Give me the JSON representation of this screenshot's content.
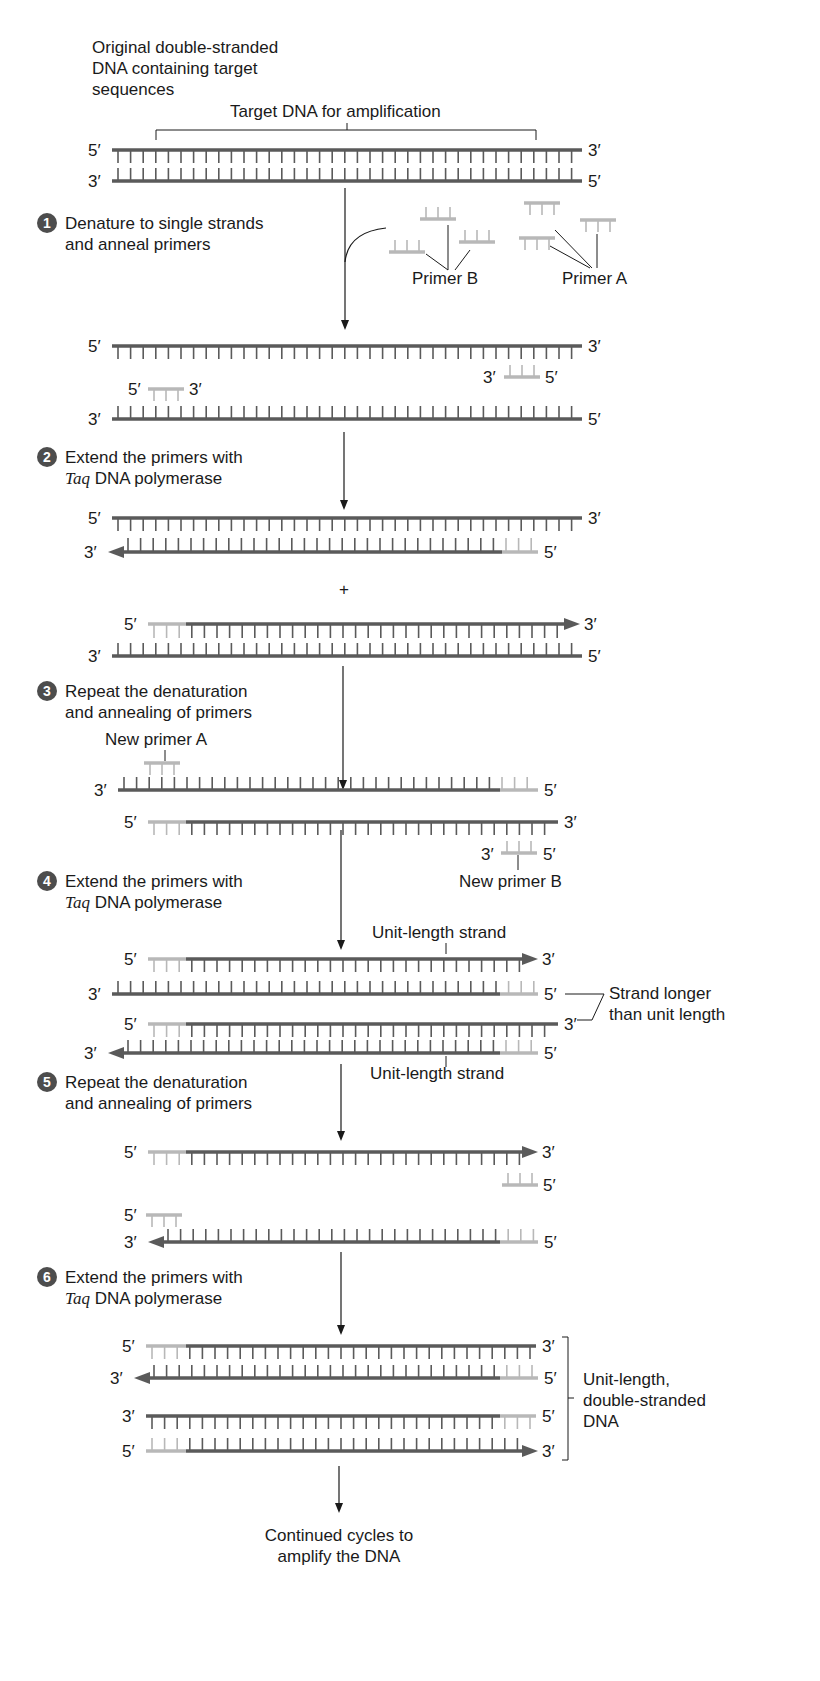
{
  "colors": {
    "strand": "#5a5a5a",
    "primer": "#b8b8b8",
    "text": "#1a1a1a",
    "step_badge": "#4d4d4d",
    "background": "#ffffff"
  },
  "header": {
    "title_lines": [
      "Original double-stranded",
      "DNA containing target",
      "sequences"
    ],
    "target_label": "Target DNA for amplification"
  },
  "steps": [
    {
      "number": "1",
      "lines": [
        "Denature to single strands",
        "and anneal primers"
      ]
    },
    {
      "number": "2",
      "lines_italic_prefix": "Taq",
      "lines": [
        "Extend the primers with",
        " DNA polymerase"
      ]
    },
    {
      "number": "3",
      "lines": [
        "Repeat the denaturation",
        "and annealing of primers"
      ]
    },
    {
      "number": "4",
      "lines_italic_prefix": "Taq",
      "lines": [
        "Extend the primers with",
        " DNA polymerase"
      ]
    },
    {
      "number": "5",
      "lines": [
        "Repeat the denaturation",
        "and annealing of primers"
      ]
    },
    {
      "number": "6",
      "lines_italic_prefix": "Taq",
      "lines": [
        "Extend the primers with",
        " DNA polymerase"
      ]
    }
  ],
  "labels": {
    "primer_a": "Primer A",
    "primer_b": "Primer B",
    "new_primer_a": "New primer A",
    "new_primer_b": "New primer B",
    "unit_length_strand": "Unit-length strand",
    "strand_longer": [
      "Strand longer",
      "than unit length"
    ],
    "unit_length_ds": [
      "Unit-length,",
      "double-stranded",
      "DNA"
    ],
    "plus": "+",
    "continued": [
      "Continued cycles to",
      "amplify the DNA"
    ]
  },
  "ends": {
    "five_prime": "5′",
    "three_prime": "3′"
  }
}
